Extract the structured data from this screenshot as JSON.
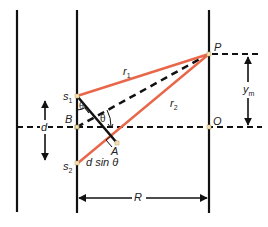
{
  "diagram": {
    "colors": {
      "ray": "#e8674a",
      "line": "#111111",
      "point_fill": "#f3e3b0",
      "background": "#ffffff"
    },
    "points": {
      "s1": {
        "label": "s",
        "sub": "1"
      },
      "s2": {
        "label": "s",
        "sub": "2"
      },
      "B": {
        "label": "B"
      },
      "A": {
        "label": "A"
      },
      "P": {
        "label": "P"
      },
      "O": {
        "label": "O"
      }
    },
    "segments": {
      "r1": {
        "label": "r",
        "sub": "1"
      },
      "r2": {
        "label": "r",
        "sub": "2"
      }
    },
    "dimensions": {
      "d": {
        "label": "d"
      },
      "ym": {
        "label": "y",
        "sub": "m"
      },
      "R": {
        "label": "R"
      },
      "path_diff": {
        "label": "d sin θ"
      }
    },
    "angles": {
      "theta_at_s1": "θ",
      "theta_at_B": "θ"
    }
  }
}
